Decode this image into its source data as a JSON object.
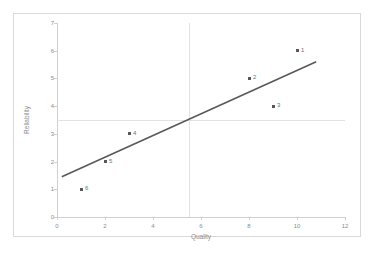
{
  "chart_data": {
    "type": "scatter",
    "title": "",
    "xlabel": "Quality",
    "ylabel": "Reliability",
    "xlim": [
      0,
      12
    ],
    "ylim": [
      0,
      7
    ],
    "xticks": [
      "0",
      "2",
      "4",
      "6",
      "8",
      "10",
      "12"
    ],
    "yticks": [
      "0",
      "1",
      "2",
      "3",
      "4",
      "5",
      "6",
      "7"
    ],
    "grid": {
      "vertical_at": 5.5,
      "horizontal_at": 3.5,
      "color": "#e2e2e2"
    },
    "legend": null,
    "points": [
      {
        "label": "1",
        "x": 10,
        "y": 6
      },
      {
        "label": "2",
        "x": 8,
        "y": 5
      },
      {
        "label": "3",
        "x": 9,
        "y": 4
      },
      {
        "label": "4",
        "x": 3,
        "y": 3
      },
      {
        "label": "5",
        "x": 2,
        "y": 2
      },
      {
        "label": "6",
        "x": 1,
        "y": 1
      }
    ],
    "trendline": {
      "x0": 0.2,
      "y0": 1.45,
      "x1": 10.8,
      "y1": 5.6,
      "color": "#595959"
    },
    "marker_color": "#585858",
    "axis_color": "#d0d0d0",
    "text_color": "#8c8c8c"
  }
}
